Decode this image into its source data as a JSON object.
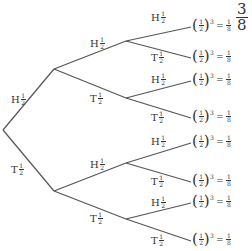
{
  "diagram": {
    "type": "probability tree",
    "line_color": "#555555",
    "nodes": {
      "root": [
        3,
        130
      ],
      "level1": [
        [
          54,
          69
        ],
        [
          54,
          191
        ]
      ],
      "level2": [
        [
          126,
          41
        ],
        [
          126,
          98
        ],
        [
          126,
          163
        ],
        [
          126,
          219
        ]
      ],
      "leaves": [
        [
          191,
          27
        ],
        [
          191,
          58
        ],
        [
          191,
          81
        ],
        [
          191,
          118
        ],
        [
          191,
          143
        ],
        [
          191,
          182
        ],
        [
          191,
          203
        ],
        [
          191,
          241
        ]
      ]
    },
    "branch_labels": [
      {
        "outcome": "H",
        "num": "1",
        "den": "2",
        "x": 11,
        "y": 93
      },
      {
        "outcome": "T",
        "num": "1",
        "den": "2",
        "x": 11,
        "y": 163
      },
      {
        "outcome": "H",
        "num": "1",
        "den": "2",
        "x": 90,
        "y": 37
      },
      {
        "outcome": "T",
        "num": "1",
        "den": "2",
        "x": 90,
        "y": 92
      },
      {
        "outcome": "H",
        "num": "1",
        "den": "2",
        "x": 90,
        "y": 158
      },
      {
        "outcome": "T",
        "num": "1",
        "den": "2",
        "x": 90,
        "y": 212
      },
      {
        "outcome": "H",
        "num": "1",
        "den": "2",
        "x": 151,
        "y": 11
      },
      {
        "outcome": "T",
        "num": "1",
        "den": "2",
        "x": 151,
        "y": 51
      },
      {
        "outcome": "H",
        "num": "1",
        "den": "2",
        "x": 151,
        "y": 73
      },
      {
        "outcome": "T",
        "num": "1",
        "den": "2",
        "x": 151,
        "y": 111
      },
      {
        "outcome": "H",
        "num": "1",
        "den": "2",
        "x": 151,
        "y": 135
      },
      {
        "outcome": "T",
        "num": "1",
        "den": "2",
        "x": 151,
        "y": 175
      },
      {
        "outcome": "H",
        "num": "1",
        "den": "2",
        "x": 151,
        "y": 196
      },
      {
        "outcome": "T",
        "num": "1",
        "den": "2",
        "x": 151,
        "y": 234
      }
    ],
    "leaf_labels": [
      {
        "base_num": "1",
        "base_den": "2",
        "exp": "3",
        "eq": "=",
        "res_num": "1",
        "res_den": "8"
      },
      {
        "base_num": "1",
        "base_den": "2",
        "exp": "3",
        "eq": "=",
        "res_num": "1",
        "res_den": "8"
      },
      {
        "base_num": "1",
        "base_den": "2",
        "exp": "3",
        "eq": "=",
        "res_num": "1",
        "res_den": "8"
      },
      {
        "base_num": "1",
        "base_den": "2",
        "exp": "3",
        "eq": "=",
        "res_num": "1",
        "res_den": "8"
      },
      {
        "base_num": "1",
        "base_den": "2",
        "exp": "3",
        "eq": "=",
        "res_num": "1",
        "res_den": "8"
      },
      {
        "base_num": "1",
        "base_den": "2",
        "exp": "3",
        "eq": "=",
        "res_num": "1",
        "res_den": "8"
      },
      {
        "base_num": "1",
        "base_den": "2",
        "exp": "3",
        "eq": "=",
        "res_num": "1",
        "res_den": "8"
      },
      {
        "base_num": "1",
        "base_den": "2",
        "exp": "3",
        "eq": "=",
        "res_num": "1",
        "res_den": "8"
      }
    ],
    "side_fraction": {
      "num": "3",
      "den": "8"
    }
  }
}
